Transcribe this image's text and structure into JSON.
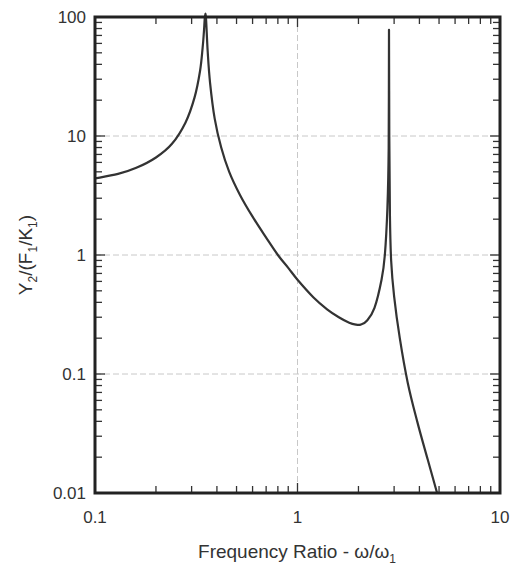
{
  "chart_data": {
    "type": "line",
    "title": "",
    "xlabel": "Frequency Ratio - ω/ω₁",
    "xlabel_main": "Frequency Ratio - ω/ω",
    "xlabel_sub": "1",
    "ylabel": "Y₂/(F₁/K₁)",
    "ylabel_parts": [
      "Y",
      "2",
      "/(F",
      "1",
      "/K",
      "1",
      ")"
    ],
    "xscale": "log",
    "yscale": "log",
    "xlim": [
      0.1,
      10
    ],
    "ylim": [
      0.01,
      100
    ],
    "x_ticks": [
      0.1,
      1,
      10
    ],
    "x_tick_labels": [
      "0.1",
      "1",
      "10"
    ],
    "y_ticks": [
      0.01,
      0.1,
      1,
      10,
      100
    ],
    "y_tick_labels": [
      "0.01",
      "0.1",
      "1",
      "10",
      "100"
    ],
    "grid": true,
    "legend": null,
    "annotations": [],
    "series": [
      {
        "name": "Y2/(F1/K1)",
        "color": "#333333",
        "x": [
          0.1,
          0.13,
          0.16,
          0.2,
          0.24,
          0.28,
          0.31,
          0.33,
          0.34,
          0.345,
          0.349,
          0.353,
          0.36,
          0.37,
          0.39,
          0.42,
          0.46,
          0.52,
          0.6,
          0.7,
          0.8,
          0.9,
          1.0,
          1.2,
          1.4,
          1.6,
          1.8,
          1.95,
          2.05,
          2.2,
          2.4,
          2.6,
          2.7,
          2.78,
          2.82,
          2.83,
          2.84,
          2.86,
          2.9,
          3.0,
          3.2,
          3.5,
          3.9,
          4.4,
          4.89
        ],
        "y": [
          4.4,
          4.8,
          5.4,
          6.6,
          8.6,
          13,
          21,
          35,
          55,
          75,
          100,
          100,
          52,
          28,
          14,
          8.0,
          5.0,
          3.2,
          2.1,
          1.4,
          1.0,
          0.78,
          0.62,
          0.44,
          0.35,
          0.3,
          0.27,
          0.26,
          0.26,
          0.28,
          0.36,
          0.62,
          1.0,
          2.5,
          8,
          78,
          10,
          2.2,
          0.9,
          0.45,
          0.2,
          0.085,
          0.04,
          0.019,
          0.01
        ]
      }
    ]
  }
}
